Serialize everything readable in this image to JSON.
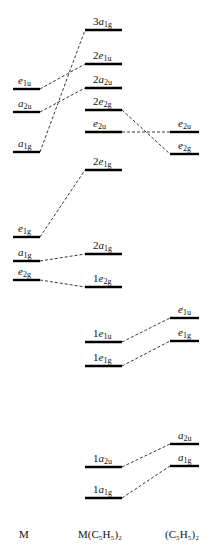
{
  "columns": [
    {
      "id": "M",
      "label": "M",
      "x": 25
    },
    {
      "id": "MCp2",
      "label": "M(C₅H₅)₂",
      "x": 103
    },
    {
      "id": "Cp2",
      "label": "(C₅H₅)₂",
      "x": 186
    }
  ],
  "levels": {
    "M": [
      {
        "id": "m_e1u",
        "pre": "",
        "sym": "e",
        "sub": "1u",
        "y": 89
      },
      {
        "id": "m_a2u",
        "pre": "",
        "sym": "a",
        "sub": "2u",
        "y": 112
      },
      {
        "id": "m_a1g_4s",
        "pre": "",
        "sym": "a",
        "sub": "1g",
        "y": 152
      },
      {
        "id": "m_e1g",
        "pre": "",
        "sym": "e",
        "sub": "1g",
        "y": 237
      },
      {
        "id": "m_a1g",
        "pre": "",
        "sym": "a",
        "sub": "1g",
        "y": 261
      },
      {
        "id": "m_e2g",
        "pre": "",
        "sym": "e",
        "sub": "2g",
        "y": 280
      }
    ],
    "MCp2": [
      {
        "id": "c_3a1g",
        "pre": "3",
        "sym": "a",
        "sub": "1g",
        "y": 30
      },
      {
        "id": "c_2e1u",
        "pre": "2",
        "sym": "e",
        "sub": "1u",
        "y": 64
      },
      {
        "id": "c_2a2u",
        "pre": "2",
        "sym": "a",
        "sub": "2u",
        "y": 88
      },
      {
        "id": "c_2e2g",
        "pre": "2",
        "sym": "e",
        "sub": "2g",
        "y": 110
      },
      {
        "id": "c_e2u",
        "pre": "",
        "sym": "e",
        "sub": "2u",
        "y": 132
      },
      {
        "id": "c_2e1g",
        "pre": "2",
        "sym": "e",
        "sub": "1g",
        "y": 170
      },
      {
        "id": "c_2a1g",
        "pre": "2",
        "sym": "a",
        "sub": "1g",
        "y": 254
      },
      {
        "id": "c_1e2g",
        "pre": "1",
        "sym": "e",
        "sub": "2g",
        "y": 287
      },
      {
        "id": "c_1e1u",
        "pre": "1",
        "sym": "e",
        "sub": "1u",
        "y": 342
      },
      {
        "id": "c_1e1g",
        "pre": "1",
        "sym": "e",
        "sub": "1g",
        "y": 366
      },
      {
        "id": "c_1a2u",
        "pre": "1",
        "sym": "a",
        "sub": "2u",
        "y": 467
      },
      {
        "id": "c_1a1g",
        "pre": "1",
        "sym": "a",
        "sub": "1g",
        "y": 498
      }
    ],
    "Cp2": [
      {
        "id": "l_e2u",
        "pre": "",
        "sym": "e",
        "sub": "2u",
        "y": 132
      },
      {
        "id": "l_e2g",
        "pre": "",
        "sym": "e",
        "sub": "2g",
        "y": 154
      },
      {
        "id": "l_e1u",
        "pre": "",
        "sym": "e",
        "sub": "1u",
        "y": 318
      },
      {
        "id": "l_e1g",
        "pre": "",
        "sym": "e",
        "sub": "1g",
        "y": 341
      },
      {
        "id": "l_a2u",
        "pre": "",
        "sym": "a",
        "sub": "2u",
        "y": 444
      },
      {
        "id": "l_a1g",
        "pre": "",
        "sym": "a",
        "sub": "1g",
        "y": 466
      }
    ]
  },
  "correlations": [
    [
      "m_e1u",
      "c_2e1u"
    ],
    [
      "m_a2u",
      "c_2a2u"
    ],
    [
      "m_a1g_4s",
      "c_3a1g"
    ],
    [
      "m_e1g",
      "c_2e1g"
    ],
    [
      "m_a1g",
      "c_2a1g"
    ],
    [
      "m_e2g",
      "c_1e2g"
    ],
    [
      "c_2e2g",
      "l_e2g"
    ],
    [
      "c_e2u",
      "l_e2u"
    ],
    [
      "c_1e1u",
      "l_e1u"
    ],
    [
      "c_1e1g",
      "l_e1g"
    ],
    [
      "c_1a2u",
      "l_a2u"
    ],
    [
      "c_1a1g",
      "l_a1g"
    ]
  ]
}
